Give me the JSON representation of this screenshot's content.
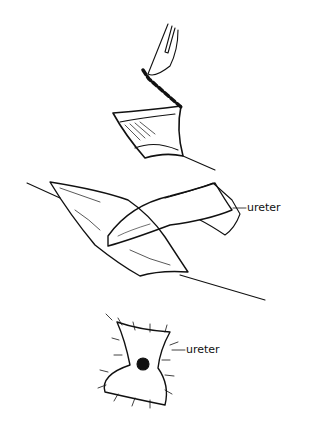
{
  "figure": {
    "panels": [
      {
        "id": "panel-1",
        "description": "scalpel incising along dashed line on bladder flap"
      },
      {
        "id": "panel-2",
        "description": "ureter drawn through flap",
        "label": "ureter"
      },
      {
        "id": "panel-3",
        "description": "sutured flap with ureter orifice",
        "label": "ureter"
      }
    ]
  }
}
